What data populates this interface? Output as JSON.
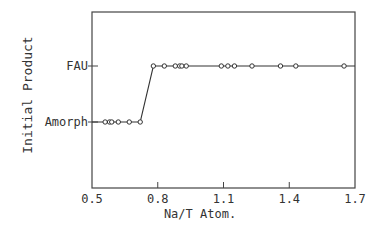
{
  "chart_data": {
    "type": "line",
    "title": "",
    "xlabel": "Na/T Atom.",
    "ylabel": "Initial Product",
    "xlim": [
      0.5,
      1.7
    ],
    "xticks": [
      "0.5",
      "0.8",
      "1.1",
      "1.4",
      "1.7"
    ],
    "xtick_values": [
      0.5,
      0.8,
      1.1,
      1.4,
      1.7
    ],
    "ycategories": [
      "Amorph",
      "FAU"
    ],
    "grid": false,
    "legend": "none",
    "series": [
      {
        "name": "Initial Product",
        "marker": "open-circle",
        "points": [
          {
            "x": 0.56,
            "y": "Amorph"
          },
          {
            "x": 0.58,
            "y": "Amorph"
          },
          {
            "x": 0.59,
            "y": "Amorph"
          },
          {
            "x": 0.62,
            "y": "Amorph"
          },
          {
            "x": 0.67,
            "y": "Amorph"
          },
          {
            "x": 0.72,
            "y": "Amorph"
          },
          {
            "x": 0.78,
            "y": "FAU"
          },
          {
            "x": 0.83,
            "y": "FAU"
          },
          {
            "x": 0.88,
            "y": "FAU"
          },
          {
            "x": 0.9,
            "y": "FAU"
          },
          {
            "x": 0.91,
            "y": "FAU"
          },
          {
            "x": 0.93,
            "y": "FAU"
          },
          {
            "x": 1.09,
            "y": "FAU"
          },
          {
            "x": 1.12,
            "y": "FAU"
          },
          {
            "x": 1.15,
            "y": "FAU"
          },
          {
            "x": 1.23,
            "y": "FAU"
          },
          {
            "x": 1.36,
            "y": "FAU"
          },
          {
            "x": 1.43,
            "y": "FAU"
          },
          {
            "x": 1.65,
            "y": "FAU"
          }
        ]
      }
    ]
  }
}
